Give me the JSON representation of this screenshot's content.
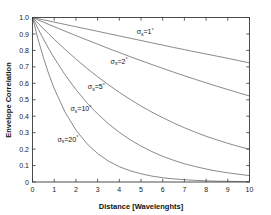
{
  "chart_data": {
    "type": "line",
    "title": "",
    "xlabel": "Distance [Wavelenghts]",
    "ylabel": "Envelope Correlation",
    "xlim": [
      0,
      10
    ],
    "ylim": [
      0,
      1.0
    ],
    "xticks": [
      "0",
      "1",
      "2",
      "3",
      "4",
      "5",
      "6",
      "7",
      "8",
      "9",
      "10"
    ],
    "xtick_values": [
      0,
      1,
      2,
      3,
      4,
      5,
      6,
      7,
      8,
      9,
      10
    ],
    "yticks": [
      "0",
      "0.1",
      "0.2",
      "0.3",
      "0.4",
      "0.5",
      "0.6",
      "0.7",
      "0.8",
      "0.9",
      "1.0"
    ],
    "ytick_values": [
      0,
      0.1,
      0.2,
      0.3,
      0.4,
      0.5,
      0.6,
      0.7,
      0.8,
      0.9,
      1.0
    ],
    "grid": false,
    "legend": "inline-annotations",
    "x": [
      0,
      0.25,
      0.5,
      0.75,
      1,
      1.5,
      2,
      2.5,
      3,
      3.5,
      4,
      4.5,
      5,
      5.5,
      6,
      6.5,
      7,
      7.5,
      8,
      8.5,
      9,
      9.5,
      10
    ],
    "series": [
      {
        "name": "sigma_s = 1 deg",
        "label": "σ",
        "label_sub": "s",
        "label_value": "=1",
        "label_unit": "°",
        "sigma_deg": 1,
        "values": [
          1.0,
          0.993,
          0.986,
          0.979,
          0.972,
          0.958,
          0.944,
          0.93,
          0.916,
          0.902,
          0.888,
          0.874,
          0.86,
          0.846,
          0.832,
          0.818,
          0.805,
          0.791,
          0.778,
          0.765,
          0.752,
          0.738,
          0.724
        ],
        "annotation_x": 4.8,
        "annotation_y": 0.9
      },
      {
        "name": "sigma_s = 2 deg",
        "label": "σ",
        "label_sub": "s",
        "label_value": "=2",
        "label_unit": "°",
        "sigma_deg": 2,
        "values": [
          1.0,
          0.986,
          0.972,
          0.958,
          0.944,
          0.917,
          0.89,
          0.864,
          0.838,
          0.812,
          0.787,
          0.762,
          0.738,
          0.714,
          0.691,
          0.668,
          0.646,
          0.624,
          0.603,
          0.582,
          0.562,
          0.542,
          0.523
        ],
        "annotation_x": 3.6,
        "annotation_y": 0.72
      },
      {
        "name": "sigma_s = 5 deg",
        "label": "σ",
        "label_sub": "s",
        "label_value": "=5",
        "label_unit": "°",
        "sigma_deg": 5,
        "values": [
          1.0,
          0.966,
          0.933,
          0.9,
          0.868,
          0.806,
          0.748,
          0.692,
          0.64,
          0.591,
          0.545,
          0.502,
          0.462,
          0.425,
          0.391,
          0.359,
          0.33,
          0.303,
          0.278,
          0.256,
          0.235,
          0.216,
          0.199
        ],
        "annotation_x": 2.55,
        "annotation_y": 0.565
      },
      {
        "name": "sigma_s = 10 deg",
        "label": "σ",
        "label_sub": "s",
        "label_value": "=10",
        "label_unit": "°",
        "sigma_deg": 10,
        "values": [
          1.0,
          0.933,
          0.87,
          0.81,
          0.754,
          0.652,
          0.562,
          0.483,
          0.414,
          0.354,
          0.302,
          0.257,
          0.218,
          0.185,
          0.156,
          0.132,
          0.111,
          0.094,
          0.079,
          0.066,
          0.056,
          0.047,
          0.039
        ],
        "annotation_x": 1.75,
        "annotation_y": 0.43
      },
      {
        "name": "sigma_s = 20 deg",
        "label": "σ",
        "label_sub": "s",
        "label_value": "=20",
        "label_unit": "°",
        "sigma_deg": 20,
        "values": [
          1.0,
          0.871,
          0.757,
          0.656,
          0.568,
          0.425,
          0.316,
          0.234,
          0.173,
          0.127,
          0.093,
          0.068,
          0.05,
          0.036,
          0.026,
          0.019,
          0.014,
          0.01,
          0.007,
          0.005,
          0.004,
          0.003,
          0.002
        ],
        "annotation_x": 1.15,
        "annotation_y": 0.245
      }
    ],
    "colors": {
      "curve": "#6b6b6b",
      "axis": "#3a3a3a",
      "text": "#111111",
      "background": "#ffffff"
    }
  }
}
